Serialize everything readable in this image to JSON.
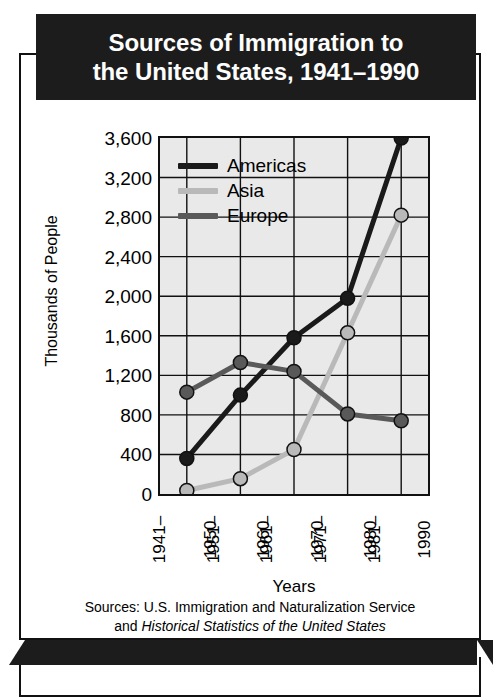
{
  "title": {
    "line1": "Sources of Immigration to",
    "line2": "the United States, 1941–1990"
  },
  "sources": {
    "line1": "Sources: U.S. Immigration and Naturalization Service",
    "line2_prefix": "and ",
    "line2_italic": "Historical Statistics of the United States"
  },
  "colors": {
    "americas": "#1a1a1a",
    "asia": "#b9b9b9",
    "europe": "#595959",
    "plot_background": "#e9e9e9",
    "gridline": "#111111",
    "banner": "#1c1c1c",
    "page_background": "#ffffff"
  },
  "chart_data": {
    "type": "line",
    "title": "Sources of Immigration to the United States, 1941–1990",
    "xlabel": "Years",
    "ylabel": "Thousands of People",
    "categories": [
      "1941–1950",
      "1951–1960",
      "1961–1970",
      "1971–1980",
      "1981–1990"
    ],
    "category_lines": [
      [
        "1941–",
        "1950"
      ],
      [
        "1951–",
        "1960"
      ],
      [
        "1961–",
        "1970"
      ],
      [
        "1971–",
        "1980"
      ],
      [
        "1981–",
        "1990"
      ]
    ],
    "ylim": [
      0,
      3600
    ],
    "ytick_values": [
      3600,
      3200,
      2800,
      2400,
      2000,
      1600,
      1200,
      800,
      400,
      0
    ],
    "ytick_labels": [
      "3,600",
      "3,200",
      "2,800",
      "2,400",
      "2,000",
      "1,600",
      "1,200",
      "800",
      "400",
      "0"
    ],
    "grid": true,
    "legend_position": "upper-left-inside",
    "series": [
      {
        "name": "Americas",
        "color": "#1a1a1a",
        "values": [
          360,
          1000,
          1580,
          1980,
          3600
        ]
      },
      {
        "name": "Asia",
        "color": "#b9b9b9",
        "values": [
          35,
          155,
          450,
          1630,
          2820
        ]
      },
      {
        "name": "Europe",
        "color": "#595959",
        "values": [
          1030,
          1330,
          1240,
          810,
          740
        ]
      }
    ]
  }
}
